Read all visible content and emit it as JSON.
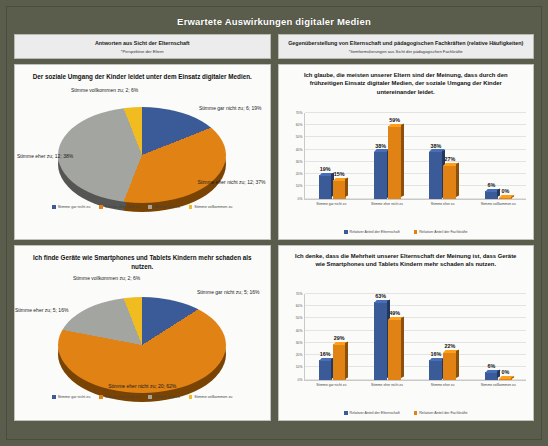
{
  "poster": {
    "title": "Erwartete Auswirkungen digitaler Medien",
    "frame_color": "#5b5d4c"
  },
  "colors": {
    "blue": "#3a5a98",
    "orange": "#e08214",
    "gray": "#a3a5a0",
    "yellow": "#f0bc20"
  },
  "columns": {
    "left": {
      "header": "Antworten aus Sicht der Elternschaft",
      "subheader": "*Perspektive der Eltern"
    },
    "right": {
      "header": "Gegenüberstellung von Elternschaft und pädagogischen Fachkräften (relative Häufigkeiten)",
      "subheader": "*Itemformulierungen aus Sicht der pädagogischen Fachkräfte"
    }
  },
  "chart_data": [
    {
      "id": "pie-soziale-umgang",
      "type": "pie",
      "title": "Der soziale Umgang der Kinder leidet unter dem Einsatz digitaler Medien.",
      "categories": [
        "Stimme gar nicht zu",
        "Stimme eher nicht zu",
        "Stimme eher zu",
        "Stimme vollkommen zu"
      ],
      "values": [
        19,
        37,
        38,
        6
      ],
      "counts": [
        6,
        12,
        12,
        2
      ],
      "colors": [
        "#3a5a98",
        "#e08214",
        "#a3a5a0",
        "#f0bc20"
      ],
      "labels": [
        "Stimme gar nicht zu; 6; 19%",
        "Stimme eher nicht zu; 12; 37%",
        "Stimme eher zu; 12; 38%",
        "Stimme vollkommen zu; 2; 6%"
      ],
      "legend": [
        "Stimme gar nicht zu",
        "Stimme eher nicht zu",
        "Stimme eher zu",
        "Stimme vollkommen zu"
      ],
      "legend_position": "bottom"
    },
    {
      "id": "bar-soziale-umgang",
      "type": "bar",
      "title": "Ich glaube, die meisten unserer Eltern sind der Meinung, dass durch den frühzeitigen Einsatz digitaler Medien, der soziale Umgang der Kinder untereinander leidet.",
      "categories": [
        "Stimme gar nicht zu",
        "Stimme eher nicht zu",
        "Stimme eher zu",
        "Stimme vollkommen zu"
      ],
      "series": [
        {
          "name": "Relativer Anteil der Elternschaft",
          "values": [
            19,
            38,
            38,
            6
          ],
          "color": "#3a5a98"
        },
        {
          "name": "Relativer Anteil der Fachkräfte",
          "values": [
            15,
            59,
            27,
            0
          ],
          "color": "#e08214"
        }
      ],
      "ylim": [
        0,
        70
      ],
      "yticks": [
        "0%",
        "10%",
        "20%",
        "30%",
        "40%",
        "50%",
        "60%",
        "70%"
      ],
      "xlabel": "",
      "ylabel": "",
      "grid": true,
      "legend_position": "bottom"
    },
    {
      "id": "pie-geraete-schaden",
      "type": "pie",
      "title": "Ich finde Geräte wie Smartphones und Tablets Kindern mehr schaden als nutzen.",
      "categories": [
        "Stimme gar nicht zu",
        "Stimme eher nicht zu",
        "Stimme eher zu",
        "Stimme vollkommen zu"
      ],
      "values": [
        16,
        62,
        16,
        6
      ],
      "counts": [
        5,
        20,
        5,
        2
      ],
      "colors": [
        "#3a5a98",
        "#e08214",
        "#a3a5a0",
        "#f0bc20"
      ],
      "labels": [
        "Stimme gar nicht zu; 5; 16%",
        "Stimme eher nicht zu; 20; 62%",
        "Stimme eher zu; 5; 16%",
        "Stimme vollkommen zu; 2; 6%"
      ],
      "legend": [
        "Stimme gar nicht zu",
        "Stimme eher nicht zu",
        "Stimme eher zu",
        "Stimme vollkommen zu"
      ],
      "legend_position": "bottom"
    },
    {
      "id": "bar-geraete-schaden",
      "type": "bar",
      "title": "Ich denke, dass die Mehrheit unserer Elternschaft der Meinung ist, dass Geräte wie Smartphones und Tablets Kindern mehr schaden als nutzen.",
      "categories": [
        "Stimme gar nicht zu",
        "Stimme eher nicht zu",
        "Stimme eher zu",
        "Stimme vollkommen zu"
      ],
      "series": [
        {
          "name": "Relativer Anteil der Elternschaft",
          "values": [
            16,
            63,
            16,
            6
          ],
          "color": "#3a5a98"
        },
        {
          "name": "Relativer Anteil der Fachkräfte",
          "values": [
            29,
            49,
            22,
            0
          ],
          "color": "#e08214"
        }
      ],
      "ylim": [
        0,
        70
      ],
      "yticks": [
        "0%",
        "10%",
        "20%",
        "30%",
        "40%",
        "50%",
        "60%",
        "70%"
      ],
      "xlabel": "",
      "ylabel": "",
      "grid": true,
      "legend_position": "bottom"
    }
  ]
}
